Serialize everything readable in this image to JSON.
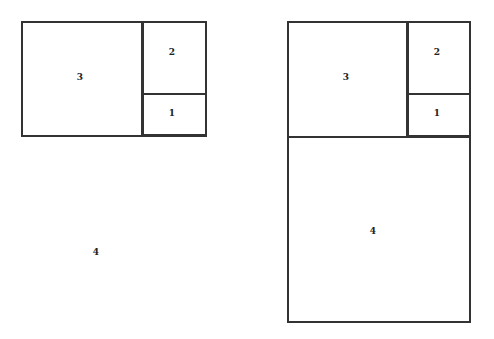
{
  "left_diagram": {
    "labels": {
      "sq3": "3",
      "sq2": "2",
      "sq1": "1",
      "sq4": "4"
    }
  },
  "right_diagram": {
    "labels": {
      "sq3": "3",
      "sq2": "2",
      "sq1": "1",
      "sq4": "4"
    }
  },
  "colors": {
    "stroke": "#333333",
    "background": "#ffffff"
  }
}
